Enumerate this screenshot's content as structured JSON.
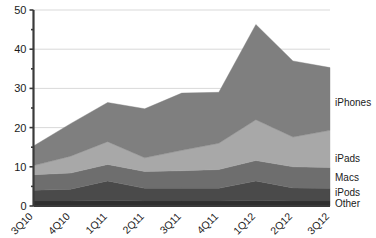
{
  "chart_data": {
    "type": "area",
    "stacked": true,
    "title": "",
    "xlabel": "",
    "ylabel": "",
    "categories": [
      "3Q10",
      "4Q10",
      "1Q11",
      "2Q11",
      "3Q11",
      "4Q11",
      "1Q12",
      "2Q12",
      "3Q12"
    ],
    "ylim": [
      0,
      50
    ],
    "yticks": [
      0,
      10,
      20,
      30,
      40,
      50
    ],
    "yticks_minor": [
      5,
      15,
      25,
      35,
      45
    ],
    "grid": true,
    "legend_position": "right-inline",
    "series": [
      {
        "name": "Other",
        "color": "#2f2f2f",
        "values": [
          1.3,
          1.3,
          1.4,
          1.3,
          1.3,
          1.3,
          1.4,
          1.3,
          1.3
        ]
      },
      {
        "name": "iPods",
        "color": "#4a4a4a",
        "values": [
          2.7,
          3.0,
          5.0,
          3.2,
          3.2,
          3.2,
          5.0,
          3.3,
          3.2
        ]
      },
      {
        "name": "Macs",
        "color": "#6e6e6e",
        "values": [
          4.0,
          4.1,
          4.2,
          4.3,
          4.5,
          4.8,
          5.2,
          5.4,
          5.3
        ]
      },
      {
        "name": "iPads",
        "color": "#a8a8a8",
        "values": [
          2.3,
          4.3,
          5.8,
          3.5,
          5.2,
          6.7,
          10.4,
          7.6,
          9.5
        ]
      },
      {
        "name": "iPhones",
        "color": "#7f7f7f",
        "values": [
          5.0,
          8.3,
          10.0,
          12.5,
          14.6,
          13.0,
          24.3,
          19.4,
          16.0
        ]
      }
    ],
    "totals": [
      15.3,
      21.0,
      26.4,
      24.8,
      28.8,
      29.0,
      46.3,
      37.0,
      35.3
    ],
    "legend_labels": [
      "iPhones",
      "iPads",
      "Macs",
      "iPods",
      "Other"
    ]
  },
  "axis": {
    "y_labels": [
      "50",
      "40",
      "30",
      "20",
      "10",
      "0"
    ]
  }
}
